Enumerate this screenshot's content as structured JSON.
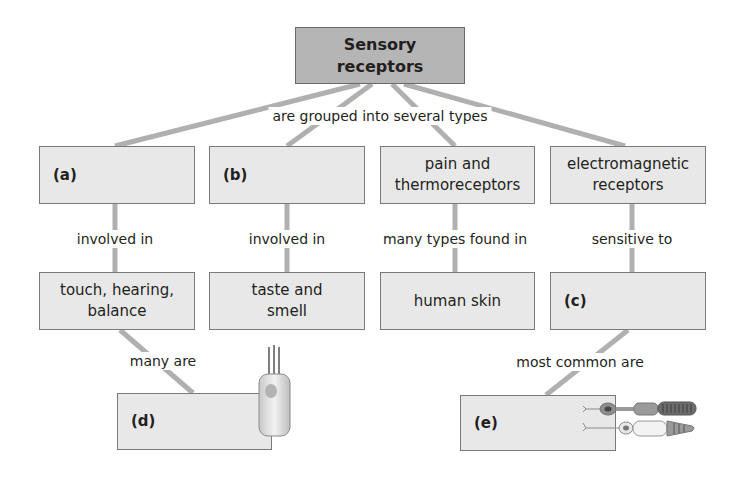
{
  "root": {
    "label": "Sensory receptors"
  },
  "root_link": "are grouped into several types",
  "columns": [
    {
      "type_label": "(a)",
      "type_is_blank": true,
      "link": "involved in",
      "detail": "touch, hearing, balance"
    },
    {
      "type_label": "(b)",
      "type_is_blank": true,
      "link": "involved in",
      "detail": "taste and smell"
    },
    {
      "type_label": "pain and thermoreceptors",
      "type_is_blank": false,
      "link": "many types found in",
      "detail": "human skin"
    },
    {
      "type_label": "electromagnetic receptors",
      "type_is_blank": false,
      "link": "sensitive to",
      "detail": "(c)"
    }
  ],
  "sub": [
    {
      "from": "touch, hearing, balance",
      "link": "many are",
      "label": "(d)",
      "icon": "hair-cell-icon"
    },
    {
      "from": "(c)",
      "link": "most common are",
      "label": "(e)",
      "icon": "photoreceptor-rod-cone-icon"
    }
  ],
  "colors": {
    "box_fill": "#e8e8e8",
    "root_fill": "#b5b5b5",
    "connector": "#b0b0b0",
    "border": "#7a7a7a"
  }
}
